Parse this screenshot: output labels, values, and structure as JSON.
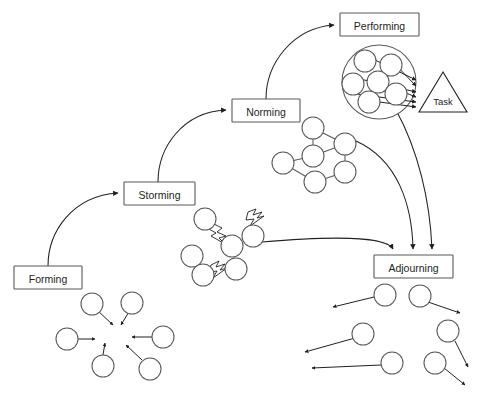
{
  "diagram": {
    "background_color": "#ffffff",
    "stroke_color": "#58595b",
    "text_color": "#231f20",
    "width": 485,
    "height": 398
  },
  "stages": [
    {
      "id": "forming",
      "label": "Forming",
      "x": 14,
      "y": 266,
      "w": 68,
      "h": 23
    },
    {
      "id": "storming",
      "label": "Storming",
      "x": 124,
      "y": 182,
      "w": 71,
      "h": 23
    },
    {
      "id": "norming",
      "label": "Norming",
      "x": 232,
      "y": 99,
      "w": 68,
      "h": 23
    },
    {
      "id": "performing",
      "label": "Performing",
      "x": 340,
      "y": 13,
      "w": 79,
      "h": 23
    },
    {
      "id": "adjourning",
      "label": "Adjourning",
      "x": 374,
      "y": 255,
      "w": 79,
      "h": 23
    }
  ],
  "task": {
    "label": "Task",
    "shape": "triangle",
    "apex_x": 443,
    "apex_y": 72,
    "base_left_x": 419,
    "base_right_x": 467,
    "base_y": 112
  },
  "transitions": [
    {
      "from": "forming",
      "to": "storming",
      "type": "curved-arrow"
    },
    {
      "from": "storming",
      "to": "norming",
      "type": "curved-arrow"
    },
    {
      "from": "norming",
      "to": "performing",
      "type": "curved-arrow"
    },
    {
      "from": "storming-cluster",
      "to": "adjourning",
      "type": "curved-arrow"
    },
    {
      "from": "norming-network",
      "to": "adjourning",
      "type": "curved-arrow"
    },
    {
      "from": "performing-cluster",
      "to": "adjourning",
      "type": "curved-arrow"
    }
  ],
  "illustrations": {
    "forming_cluster": {
      "name": "scattered members converging",
      "description": "six separate circles with arrows pointing inward toward a common centre",
      "member_count": 6
    },
    "storming_cluster": {
      "name": "members in conflict",
      "description": "six circles connected by jagged lightning-bolt conflict markers",
      "member_count": 6,
      "conflict_marker": "lightning-bolt"
    },
    "norming_network": {
      "name": "connected member network",
      "description": "six circles joined by straight lines into a cohesive lattice",
      "member_count": 6
    },
    "performing_cluster": {
      "name": "unified team focused on task",
      "description": "six circles enclosed by one large boundary circle, all arrows aimed at the Task triangle",
      "member_count": 6
    },
    "adjourning_cluster": {
      "name": "members dispersing",
      "description": "six circles with arrows pointing outward away from each other",
      "member_count": 6
    }
  }
}
